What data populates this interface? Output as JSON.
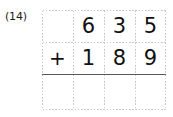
{
  "problem": {
    "label": "(14)",
    "operation_symbol": "+",
    "operation_name": "addition",
    "addend_top": "635",
    "addend_bottom": "189",
    "answer": ""
  },
  "grid": {
    "columns": 4,
    "rows": 3,
    "line_style": "dotted",
    "line_color": "#c9c9c9",
    "rule_color": "#555a5e"
  },
  "rows": {
    "top": {
      "cells": [
        "",
        "6",
        "3",
        "5"
      ]
    },
    "bottom": {
      "cells": [
        "+",
        "1",
        "8",
        "9"
      ]
    },
    "answer": {
      "cells": [
        "",
        "",
        "",
        ""
      ]
    }
  },
  "colors": {
    "background": "#ffffff",
    "ink": "#111111",
    "label": "#1a1a1a"
  }
}
